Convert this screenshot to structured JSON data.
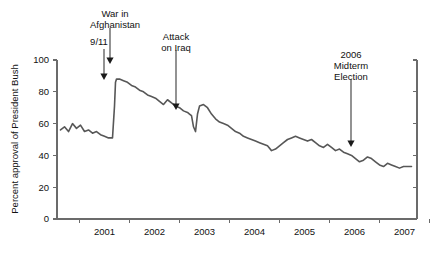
{
  "chart_data": {
    "type": "line",
    "title": "",
    "xlabel": "",
    "ylabel": "Percent approval of President Bush",
    "ylim": [
      0,
      100
    ],
    "yticks": [
      0,
      20,
      40,
      60,
      80,
      100
    ],
    "ytick_labels": [
      "0",
      "20",
      "40",
      "60",
      "80",
      "100"
    ],
    "xlim": [
      2000.55,
      2007.75
    ],
    "xticks": [
      2001,
      2002,
      2003,
      2004,
      2005,
      2006,
      2007
    ],
    "xtick_labels": [
      "2001",
      "2002",
      "2003",
      "2004",
      "2005",
      "2006",
      "2007"
    ],
    "grid": false,
    "legend": null,
    "line_color": "#575757",
    "axis_color": "#6b6b6b",
    "series": [
      {
        "name": "Percent approval of President Bush",
        "x": [
          2000.62,
          2000.7,
          2000.78,
          2000.86,
          2000.94,
          2001.02,
          2001.1,
          2001.18,
          2001.26,
          2001.34,
          2001.42,
          2001.5,
          2001.58,
          2001.66,
          2001.7,
          2001.72,
          2001.74,
          2001.8,
          2001.88,
          2001.96,
          2002.04,
          2002.12,
          2002.2,
          2002.28,
          2002.36,
          2002.44,
          2002.52,
          2002.6,
          2002.68,
          2002.76,
          2002.84,
          2002.92,
          2003.0,
          2003.08,
          2003.16,
          2003.2,
          2003.24,
          2003.28,
          2003.32,
          2003.36,
          2003.4,
          2003.48,
          2003.56,
          2003.64,
          2003.72,
          2003.8,
          2003.88,
          2003.96,
          2004.04,
          2004.12,
          2004.2,
          2004.28,
          2004.36,
          2004.44,
          2004.52,
          2004.6,
          2004.68,
          2004.76,
          2004.84,
          2004.92,
          2005.0,
          2005.08,
          2005.16,
          2005.24,
          2005.32,
          2005.4,
          2005.48,
          2005.56,
          2005.64,
          2005.72,
          2005.8,
          2005.88,
          2005.96,
          2006.04,
          2006.12,
          2006.2,
          2006.28,
          2006.36,
          2006.44,
          2006.52,
          2006.6,
          2006.68,
          2006.76,
          2006.84,
          2006.92,
          2007.0,
          2007.08,
          2007.16,
          2007.24,
          2007.32,
          2007.4,
          2007.48,
          2007.56,
          2007.64
        ],
        "y": [
          56,
          58,
          55,
          60,
          57,
          59,
          55,
          56,
          54,
          55,
          53,
          52,
          51,
          51,
          71,
          86,
          88,
          88,
          87,
          86,
          84,
          83,
          81,
          80,
          78,
          77,
          76,
          74,
          72,
          75,
          73,
          71,
          70,
          68,
          67,
          66,
          65,
          58,
          55,
          66,
          71,
          72,
          70,
          66,
          63,
          61,
          60,
          59,
          57,
          55,
          54,
          52,
          51,
          50,
          49,
          48,
          47,
          46,
          43,
          44,
          46,
          48,
          50,
          51,
          52,
          51,
          50,
          49,
          50,
          48,
          46,
          45,
          47,
          45,
          43,
          44,
          42,
          41,
          40,
          38,
          36,
          37,
          39,
          38,
          36,
          34,
          33,
          35,
          34,
          33,
          32,
          33,
          33,
          33
        ],
        "note": "Gallup-style presidential approval, monthly/biweekly, 2000.6-2007.7"
      }
    ],
    "annotations": [
      {
        "id": "nine-eleven",
        "label": "9/11",
        "label_lines": [
          "9/11"
        ],
        "text_x": 99,
        "text_y": 45,
        "arrow_from_x": 104,
        "arrow_from_y": 49,
        "arrow_to_x": 104,
        "arrow_to_y": 80,
        "target_year": 2001.72,
        "target_value": 60
      },
      {
        "id": "war-in-afghanistan",
        "label": "War in Afghanistan",
        "label_lines": [
          "War in",
          "Afghanistan"
        ],
        "text_x": 115,
        "text_y": 17,
        "arrow_from_x": 110,
        "arrow_from_y": 28,
        "arrow_to_x": 110,
        "arrow_to_y": 64,
        "target_year": 2001.8,
        "target_value": 88
      },
      {
        "id": "attack-on-iraq",
        "label": "Attack on Iraq",
        "label_lines": [
          "Attack",
          "on Iraq"
        ],
        "text_x": 176,
        "text_y": 40,
        "arrow_from_x": 176,
        "arrow_from_y": 50,
        "arrow_to_x": 176,
        "arrow_to_y": 110,
        "target_year": 2003.22,
        "target_value": 66
      },
      {
        "id": "midterm-election-2006",
        "label": "2006 Midterm Election",
        "label_lines": [
          "2006",
          "Midterm",
          "Election"
        ],
        "text_x": 351,
        "text_y": 58,
        "arrow_from_x": 351,
        "arrow_from_y": 79,
        "arrow_to_x": 351,
        "arrow_to_y": 147,
        "target_year": 2006.42,
        "target_value": 40
      }
    ]
  },
  "figure": {
    "background_color": "#ffffff",
    "plot_left_px": 57,
    "plot_right_px": 417,
    "plot_top_px": 60,
    "plot_bottom_px": 219
  }
}
